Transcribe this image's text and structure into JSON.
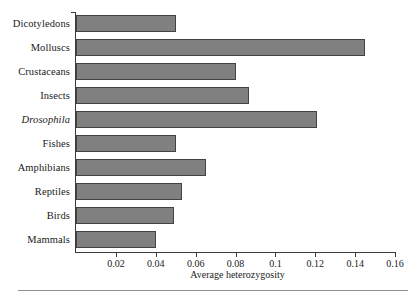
{
  "chart_data": {
    "type": "bar",
    "orientation": "horizontal",
    "title": "",
    "xlabel": "Average heterozygosity",
    "ylabel": "",
    "xlim": [
      0,
      0.16
    ],
    "xticks": [
      "0.02",
      "0.04",
      "0.06",
      "0.08",
      "0.1",
      "0.12",
      "0.14",
      "0.16"
    ],
    "xtick_values": [
      0.02,
      0.04,
      0.06,
      0.08,
      0.1,
      0.12,
      0.14,
      0.16
    ],
    "grid": false,
    "legend": false,
    "bar_color": "#808080",
    "bar_edge_color": "#434343",
    "categories": [
      "Dicotyledons",
      "Molluscs",
      "Crustaceans",
      "Insects",
      "Drosophila",
      "Fishes",
      "Amphibians",
      "Reptiles",
      "Birds",
      "Mammals"
    ],
    "values": [
      0.05,
      0.145,
      0.08,
      0.087,
      0.121,
      0.05,
      0.065,
      0.053,
      0.049,
      0.04
    ],
    "italic_categories": [
      "Drosophila"
    ]
  }
}
